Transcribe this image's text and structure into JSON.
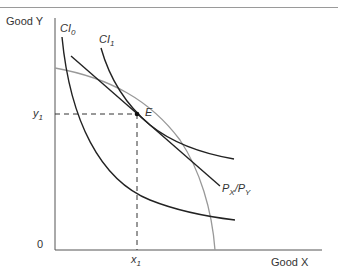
{
  "figure": {
    "y_axis_label": "Good Y",
    "x_axis_label": "Good X",
    "origin_label": "0",
    "y1_label": "y",
    "y1_sub": "1",
    "x1_label": "x",
    "x1_sub": "1",
    "point_label": "E",
    "curves": [
      {
        "name": "CI",
        "sub": "0"
      },
      {
        "name": "CI",
        "sub": "1"
      }
    ],
    "price_line_label": {
      "p1": "P",
      "s1": "X",
      "sep": "/",
      "p2": "P",
      "s2": "Y"
    }
  }
}
